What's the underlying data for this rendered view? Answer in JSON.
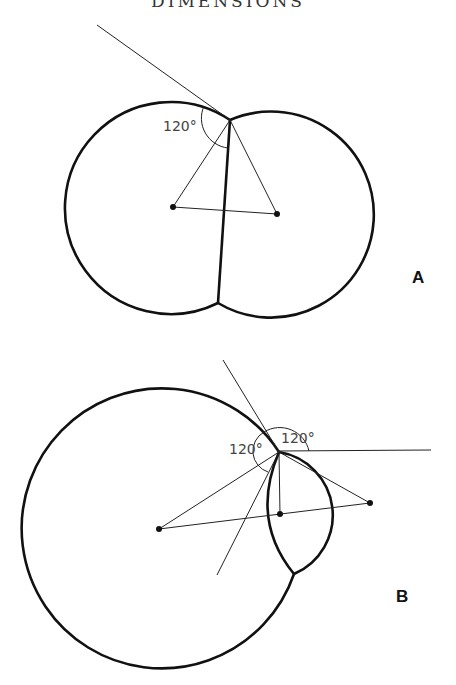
{
  "header": {
    "title": "DIMENSIONS"
  },
  "diagram_a": {
    "label": "A",
    "angle_label": "120°",
    "description": "Two equal soap-bubble circles joined by a flat dividing wall; tangent line and center triangle show 120° angle"
  },
  "diagram_b": {
    "label": "B",
    "angle_label_left": "120°",
    "angle_label_top": "120°",
    "description": "Large bubble with smaller bubble attached; curved dividing wall; construction lines to three centers showing 120° angles at junction"
  }
}
